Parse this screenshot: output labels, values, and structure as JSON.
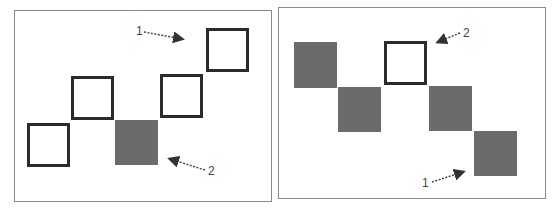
{
  "panels": [
    {
      "name": "left",
      "squares": [
        {
          "style": "outline"
        },
        {
          "style": "outline"
        },
        {
          "style": "filled"
        },
        {
          "style": "outline"
        },
        {
          "style": "outline"
        }
      ],
      "annotations": [
        {
          "label": "1",
          "points_to": "empty space right of/below top-right square"
        },
        {
          "label": "2",
          "points_to": "filled square"
        }
      ]
    },
    {
      "name": "right",
      "squares": [
        {
          "style": "filled"
        },
        {
          "style": "filled"
        },
        {
          "style": "outline"
        },
        {
          "style": "filled"
        },
        {
          "style": "filled"
        }
      ],
      "annotations": [
        {
          "label": "2",
          "points_to": "outline square"
        },
        {
          "label": "1",
          "points_to": "bottom-right filled square"
        }
      ]
    }
  ],
  "colors": {
    "outline": "#2b2b2b",
    "filled": "#6b6b6b",
    "frame": "#8a8a8a"
  }
}
